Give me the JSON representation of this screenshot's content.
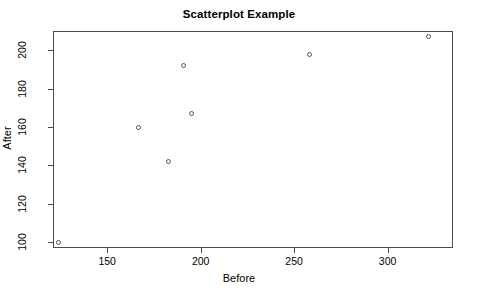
{
  "chart_data": {
    "type": "scatter",
    "title": "Scatterplot Example",
    "xlabel": "Before",
    "ylabel": "After",
    "grid": false,
    "legend": null,
    "xlim": [
      121,
      335
    ],
    "ylim": [
      97,
      210
    ],
    "xticks": [
      150,
      200,
      250,
      300
    ],
    "yticks": [
      100,
      120,
      140,
      160,
      180,
      200
    ],
    "xtick_labels": [
      "150",
      "200",
      "250",
      "300"
    ],
    "ytick_labels": [
      "100",
      "120",
      "140",
      "160",
      "180",
      "200"
    ],
    "point_marker": "open-circle",
    "point_color": "#555555",
    "frame_color": "#4d4d4d",
    "background": "#ffffff",
    "x": [
      124,
      167,
      183,
      191,
      195,
      258,
      322
    ],
    "y": [
      100,
      160,
      142,
      192,
      167,
      198,
      207
    ],
    "points": [
      {
        "before": 124,
        "after": 100
      },
      {
        "before": 167,
        "after": 160
      },
      {
        "before": 183,
        "after": 142
      },
      {
        "before": 191,
        "after": 192
      },
      {
        "before": 195,
        "after": 167
      },
      {
        "before": 258,
        "after": 198
      },
      {
        "before": 322,
        "after": 207
      }
    ]
  }
}
